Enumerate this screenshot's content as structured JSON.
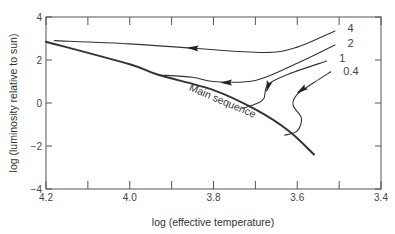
{
  "chart_data": {
    "type": "line",
    "title": "",
    "xlabel": "log (effective temperature)",
    "ylabel": "log (luminosity relative to sun)",
    "xlim": [
      4.2,
      3.4
    ],
    "ylim": [
      -4,
      4
    ],
    "x_reversed": true,
    "x_ticks": [
      "4.2",
      "4.0",
      "3.8",
      "3.6",
      "3.4"
    ],
    "x_minor_ticks": [
      4.1,
      3.9,
      3.7,
      3.5
    ],
    "y_ticks": [
      "4",
      "2",
      "0",
      "−2",
      "−4"
    ],
    "grid": false,
    "legend": "none",
    "annotations": [
      {
        "text": "Main sequence",
        "x": 3.86,
        "y": 0.6,
        "rotation": 23
      },
      {
        "text": "4",
        "x": 3.48,
        "y": 3.3
      },
      {
        "text": "2",
        "x": 3.48,
        "y": 2.6
      },
      {
        "text": "1",
        "x": 3.5,
        "y": 1.9
      },
      {
        "text": "0.4",
        "x": 3.49,
        "y": 1.3
      }
    ],
    "series": [
      {
        "name": "Main sequence",
        "points": [
          [
            4.2,
            2.85
          ],
          [
            4.0,
            1.8
          ],
          [
            3.93,
            1.3
          ],
          [
            3.8,
            0.6
          ],
          [
            3.7,
            -0.3
          ],
          [
            3.62,
            -1.3
          ],
          [
            3.56,
            -2.4
          ]
        ]
      },
      {
        "name": "4",
        "label": "4",
        "points": [
          [
            3.51,
            3.35
          ],
          [
            3.6,
            2.6
          ],
          [
            3.68,
            2.35
          ],
          [
            3.85,
            2.55
          ],
          [
            4.0,
            2.75
          ],
          [
            4.18,
            2.9
          ]
        ],
        "arrow_at": [
          3.85,
          2.55
        ]
      },
      {
        "name": "2",
        "label": "2",
        "points": [
          [
            3.51,
            2.7
          ],
          [
            3.6,
            1.85
          ],
          [
            3.7,
            1.05
          ],
          [
            3.8,
            1.0
          ],
          [
            3.85,
            1.2
          ],
          [
            3.93,
            1.3
          ]
        ],
        "arrow_at": [
          3.77,
          0.95
        ]
      },
      {
        "name": "1",
        "label": "1",
        "points": [
          [
            3.53,
            1.95
          ],
          [
            3.62,
            1.35
          ],
          [
            3.67,
            0.85
          ],
          [
            3.68,
            0.2
          ],
          [
            3.7,
            -0.05
          ],
          [
            3.73,
            -0.25
          ]
        ],
        "arrow_at": [
          3.67,
          0.75
        ]
      },
      {
        "name": "0.4",
        "label": "0.4",
        "points": [
          [
            3.52,
            1.45
          ],
          [
            3.56,
            0.95
          ],
          [
            3.6,
            0.4
          ],
          [
            3.61,
            -0.1
          ],
          [
            3.59,
            -0.7
          ],
          [
            3.6,
            -1.3
          ],
          [
            3.63,
            -1.5
          ]
        ],
        "arrow_at": [
          3.59,
          0.6
        ]
      }
    ]
  }
}
